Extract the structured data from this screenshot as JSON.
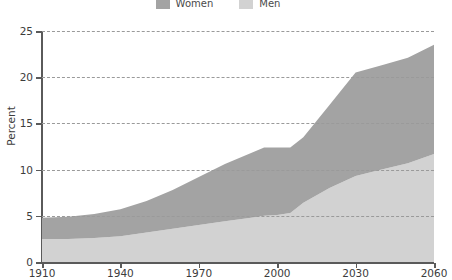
{
  "legend": {
    "position": "top-center",
    "entries": [
      {
        "label": "Women",
        "color": "#a3a3a3",
        "swatch_name": "legend-swatch-women"
      },
      {
        "label": "Men",
        "color": "#d2d2d2",
        "swatch_name": "legend-swatch-men"
      }
    ]
  },
  "chart_data": {
    "type": "area",
    "stacked": true,
    "title": "",
    "subtitle": "",
    "xlabel": "",
    "ylabel": "Percent",
    "xlim": [
      1910,
      2060
    ],
    "ylim": [
      0,
      25
    ],
    "grid": true,
    "grid_axis": "y",
    "x_ticks": [
      1910,
      1940,
      1970,
      2000,
      2030,
      2060
    ],
    "x_tick_labels": [
      "1910",
      "1940",
      "1970",
      "2000",
      "2030",
      "2060"
    ],
    "y_ticks": [
      0,
      5,
      10,
      15,
      20,
      25
    ],
    "y_tick_labels": [
      "0",
      "5",
      "10",
      "15",
      "20",
      "25"
    ],
    "x": [
      1910,
      1920,
      1930,
      1940,
      1950,
      1960,
      1970,
      1980,
      1990,
      1995,
      2000,
      2005,
      2010,
      2020,
      2030,
      2040,
      2050,
      2060
    ],
    "series": [
      {
        "name": "Men",
        "color": "#d2d2d2",
        "values": [
          2.5,
          2.5,
          2.6,
          2.8,
          3.2,
          3.6,
          4.0,
          4.4,
          4.8,
          5.0,
          5.1,
          5.3,
          6.4,
          8.0,
          9.3,
          10.0,
          10.7,
          11.7
        ]
      },
      {
        "name": "Women",
        "color": "#a3a3a3",
        "values": [
          2.3,
          2.4,
          2.6,
          2.9,
          3.4,
          4.2,
          5.2,
          6.2,
          7.0,
          7.4,
          7.3,
          7.1,
          7.1,
          9.0,
          11.2,
          11.3,
          11.4,
          11.8
        ]
      }
    ],
    "totals": [
      4.8,
      4.9,
      5.2,
      5.7,
      6.6,
      7.8,
      9.2,
      10.6,
      11.8,
      12.4,
      12.4,
      12.4,
      13.5,
      17.0,
      20.5,
      21.3,
      22.1,
      23.5
    ]
  },
  "axis_style": {
    "axis_color": "#5a5a5a",
    "grid_color": "#9a9a9a",
    "text_color": "#3c3c3c",
    "background": "#ffffff"
  }
}
